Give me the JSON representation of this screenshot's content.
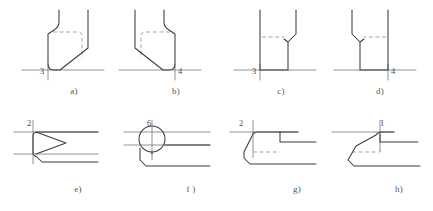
{
  "document": {
    "type": "technical-drawing-plate",
    "title": "Tool geometry cross-sections",
    "background_color": "#ffffff",
    "line_color": "#3a3d42",
    "hidden_line_color": "#9a9da2",
    "thin_line_color": "#6b6e73",
    "text_color": "#55585c"
  },
  "figures": [
    {
      "id": "a",
      "caption": "a)",
      "dimension": "3",
      "description": "vertical section, left rounded shoulder, angled lower-right chamfer, hidden rounded rectangle"
    },
    {
      "id": "b",
      "caption": "b)",
      "dimension": "4",
      "description": "vertical section, mirror of a, angled lower-left chamfer, hidden rounded rectangle"
    },
    {
      "id": "c",
      "caption": "c)",
      "dimension": "3",
      "description": "vertical section, straight sides, right shoulder step, hidden horizontal line"
    },
    {
      "id": "d",
      "caption": "d)",
      "dimension": "4",
      "description": "vertical section, mirror of c, left shoulder step, hidden horizontal line"
    },
    {
      "id": "e",
      "caption": "e)",
      "dimension": "2",
      "description": "horizontal section, triangular arrow point with centerline"
    },
    {
      "id": "f",
      "caption": "f )",
      "dimension": "6",
      "description": "horizontal section, circle with crosshair centerlines and stepped profile"
    },
    {
      "id": "g",
      "caption": "g)",
      "dimension": "2",
      "description": "horizontal section, stepped rectangular notch with hidden lines"
    },
    {
      "id": "h",
      "caption": "h)",
      "dimension": "1",
      "description": "horizontal section, angled chamfer profile with hidden lines"
    }
  ]
}
